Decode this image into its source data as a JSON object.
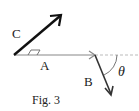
{
  "figure": {
    "caption": "Fig. 3",
    "labels": {
      "a": "A",
      "b": "B",
      "c": "C",
      "theta": "θ"
    },
    "colors": {
      "vector_a": "#888888",
      "vector_c": "#111111",
      "vector_b": "#333333",
      "dashed": "#aaaaaa"
    }
  }
}
